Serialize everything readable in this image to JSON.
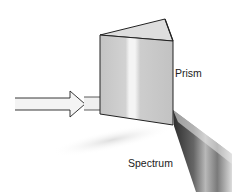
{
  "diagram": {
    "labels": {
      "prism": "Prism",
      "spectrum": "Spectrum"
    },
    "elements": [
      {
        "name": "incident-light-arrow",
        "description": "White light entering prism"
      },
      {
        "name": "prism",
        "description": "Triangular glass prism"
      },
      {
        "name": "spectrum-beam",
        "description": "Dispersed light fanning out"
      }
    ],
    "colors": {
      "background": "#ffffff",
      "outline": "#222222",
      "prism_face": "#cfcfcf",
      "prism_top": "#dcdcdc",
      "arrow_fill": "#f2f2f2",
      "beam_dark": "#3a3a3a",
      "beam_light": "#d8d8d8"
    }
  }
}
